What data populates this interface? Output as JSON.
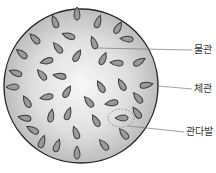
{
  "diagram": {
    "colors": {
      "background": "#ffffff",
      "circle_center": "#f7f7f7",
      "circle_edge": "#bdbdbd",
      "circle_stroke": "#2a2a2a",
      "bundle_fill": "#9a9a9a",
      "bundle_stroke": "#3a3a3a",
      "leader_line": "#777777",
      "highlight_dash": "#888888"
    },
    "labels": [
      {
        "id": "xylem",
        "text": "물관",
        "x": 194,
        "y": 44
      },
      {
        "id": "phloem",
        "text": "체관",
        "x": 194,
        "y": 83
      },
      {
        "id": "vascular-bundle",
        "text": "관다발",
        "x": 186,
        "y": 126
      }
    ]
  }
}
